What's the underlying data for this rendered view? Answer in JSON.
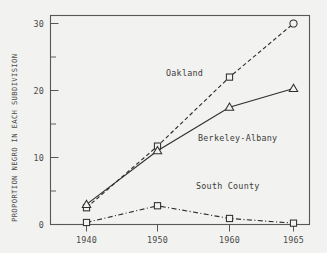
{
  "chart_data": {
    "type": "line",
    "title": "",
    "xlabel": "",
    "ylabel": "PROPORTION NEGRO IN EACH SUBDIVISION",
    "categories": [
      "1940",
      "1950",
      "1960",
      "1965"
    ],
    "x_tick_labels": [
      "1940",
      "1950",
      "1960",
      "1965"
    ],
    "y_tick_labels": [
      "0",
      "10",
      "20",
      "30"
    ],
    "y_major_ticks": [
      0,
      10,
      20,
      30
    ],
    "y_minor_ticks": [
      5,
      15,
      25
    ],
    "ylim": [
      0,
      31.5
    ],
    "grid": false,
    "legend_position": "inline-annotations",
    "series": [
      {
        "name": "Oakland",
        "label": "Oakland",
        "linestyle": "dashed",
        "marker": "square-then-circle",
        "x": [
          1940,
          1950,
          1960,
          1965
        ],
        "values": [
          2.5,
          11.7,
          22.0,
          30.0
        ]
      },
      {
        "name": "Berkeley-Albany",
        "label": "Berkeley-Albany",
        "linestyle": "solid",
        "marker": "triangle",
        "x": [
          1940,
          1950,
          1960,
          1965
        ],
        "values": [
          3.0,
          11.0,
          17.5,
          20.3
        ]
      },
      {
        "name": "South County",
        "label": "South County",
        "linestyle": "dashdot",
        "marker": "square",
        "x": [
          1940,
          1950,
          1960,
          1965
        ],
        "values": [
          0.3,
          2.8,
          0.9,
          0.2
        ]
      }
    ],
    "annotations": [
      {
        "text": "Oakland",
        "x_px": 166,
        "y_px": 76
      },
      {
        "text": "Berkeley-Albany",
        "x_px": 198,
        "y_px": 141
      },
      {
        "text": "South County",
        "x_px": 196,
        "y_px": 189
      }
    ],
    "colors": {
      "background": "#f2f2f0",
      "axis": "#57575a",
      "line": "#2f2f2f",
      "text": "#4a4a48"
    }
  }
}
